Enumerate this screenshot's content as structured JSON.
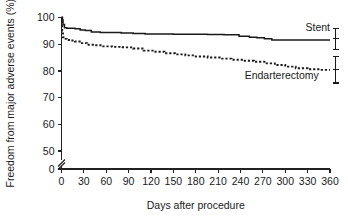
{
  "chart_data": {
    "type": "line",
    "title": "",
    "subtitle": "",
    "xlabel": "Days after procedure",
    "ylabel": "Freedom from major adverse events (%)",
    "xlim": [
      0,
      360
    ],
    "ylim": [
      50,
      100
    ],
    "y_axis_break": true,
    "y_break_note": "axis broken between 0 and 50",
    "grid": false,
    "legend_position": "inline-right",
    "xticks": [
      0,
      30,
      60,
      90,
      120,
      150,
      180,
      210,
      240,
      270,
      300,
      330,
      360
    ],
    "xticklabels": [
      "0",
      "30",
      "60",
      "90",
      "120",
      "150",
      "180",
      "210",
      "240",
      "270",
      "300",
      "330",
      "360"
    ],
    "yticks": [
      0,
      50,
      60,
      70,
      80,
      90,
      100
    ],
    "yticklabels": [
      "0",
      "50",
      "60",
      "70",
      "80",
      "90",
      "100"
    ],
    "series": [
      {
        "name": "Stent",
        "label": "Stent",
        "style": "solid",
        "color": "#1a1a1a",
        "step": true,
        "error_bar": {
          "x": 360,
          "low": 88.0,
          "high": 96.0,
          "center": 92.0
        },
        "x": [
          0,
          1,
          2,
          4,
          7,
          12,
          18,
          25,
          32,
          40,
          52,
          66,
          80,
          96,
          112,
          130,
          150,
          172,
          196,
          218,
          238,
          252,
          262,
          272,
          282,
          296,
          312,
          330,
          346,
          360
        ],
        "y": [
          100.0,
          99.2,
          97.4,
          96.2,
          96.0,
          96.0,
          95.8,
          95.3,
          95.1,
          94.6,
          94.4,
          94.4,
          94.2,
          94.0,
          93.8,
          93.8,
          93.7,
          93.7,
          93.6,
          93.5,
          93.0,
          92.6,
          92.4,
          92.0,
          91.6,
          91.6,
          91.6,
          91.6,
          91.6,
          91.6
        ]
      },
      {
        "name": "Endarterectomy",
        "label": "Endarterectomy",
        "style": "dashed",
        "color": "#1a1a1a",
        "step": true,
        "error_bar": {
          "x": 360,
          "low": 75.5,
          "high": 85.5,
          "center": 80.5
        },
        "x": [
          0,
          1,
          2,
          4,
          7,
          12,
          18,
          26,
          34,
          44,
          56,
          68,
          82,
          96,
          110,
          124,
          138,
          152,
          166,
          180,
          196,
          212,
          228,
          244,
          258,
          272,
          286,
          300,
          314,
          330,
          346,
          360
        ],
        "y": [
          100.0,
          95.0,
          92.6,
          92.0,
          91.6,
          91.4,
          91.0,
          90.4,
          89.8,
          89.6,
          89.2,
          89.0,
          88.8,
          88.4,
          87.6,
          87.2,
          86.6,
          86.2,
          85.8,
          85.4,
          85.0,
          84.6,
          84.2,
          83.8,
          83.4,
          82.8,
          82.2,
          81.6,
          81.0,
          80.6,
          80.4,
          80.4
        ]
      }
    ],
    "annotations": [
      {
        "text": "Stent",
        "x": 360,
        "y": 95.0,
        "anchor": "end"
      },
      {
        "text": "Endarterectomy",
        "x": 345,
        "y": 77.0,
        "anchor": "end"
      }
    ]
  },
  "axes": {
    "y_title": "Freedom from major adverse events (%)",
    "x_title": "Days after procedure"
  }
}
